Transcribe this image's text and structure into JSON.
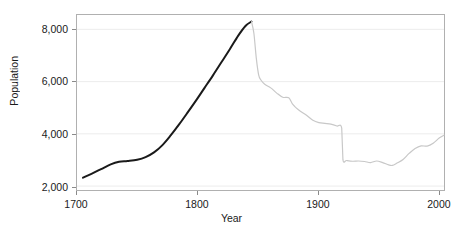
{
  "chart_data": {
    "type": "line",
    "title": "",
    "xlabel": "Year",
    "ylabel": "Population",
    "xlim": [
      1700,
      2005
    ],
    "ylim": [
      1850,
      8550
    ],
    "grid": true,
    "grid_axis": "y",
    "legend": "none",
    "xticks": [
      1700,
      1800,
      1900,
      2000
    ],
    "xtick_labels": [
      "1700",
      "1800",
      "1900",
      "2000"
    ],
    "yticks": [
      2000,
      4000,
      6000,
      8000
    ],
    "ytick_labels": [
      "2,000",
      "4,000",
      "6,000",
      "8,000"
    ],
    "colors": {
      "pre_famine_line": "#1a1a1a",
      "post_famine_line": "#c8c8c8",
      "gridline": "#ececec",
      "frame": "#b0b0b0",
      "text": "#1a1a1a"
    },
    "series": [
      {
        "name": "pre_famine",
        "color": "#1a1a1a",
        "width": 2.0,
        "x": [
          1705,
          1712,
          1720,
          1728,
          1735,
          1742,
          1750,
          1757,
          1764,
          1771,
          1778,
          1785,
          1792,
          1799,
          1806,
          1813,
          1820,
          1827,
          1834,
          1840,
          1845
        ],
        "y": [
          2320,
          2470,
          2650,
          2830,
          2930,
          2960,
          3010,
          3110,
          3290,
          3570,
          3950,
          4370,
          4820,
          5280,
          5760,
          6240,
          6740,
          7240,
          7760,
          8130,
          8300
        ]
      },
      {
        "name": "post_famine",
        "color": "#c8c8c8",
        "width": 1.2,
        "x": [
          1845,
          1847,
          1849,
          1851,
          1853,
          1856,
          1861,
          1866,
          1871,
          1876,
          1879,
          1884,
          1891,
          1896,
          1901,
          1906,
          1911,
          1916,
          1920,
          1921,
          1924,
          1929,
          1934,
          1939,
          1944,
          1949,
          1954,
          1959,
          1962,
          1966,
          1971,
          1976,
          1981,
          1986,
          1991,
          1996,
          2001,
          2005
        ],
        "y": [
          8300,
          7850,
          6900,
          6250,
          6050,
          5900,
          5760,
          5560,
          5400,
          5380,
          5150,
          4920,
          4700,
          4520,
          4430,
          4400,
          4370,
          4300,
          4220,
          3010,
          2980,
          2950,
          2960,
          2940,
          2900,
          2960,
          2900,
          2810,
          2790,
          2880,
          3020,
          3250,
          3440,
          3540,
          3530,
          3640,
          3840,
          3950
        ]
      }
    ],
    "annotations": [
      {
        "label": "peak",
        "x": 1845,
        "y": 8300,
        "note": "pre-famine maximum"
      },
      {
        "label": "discontinuity",
        "x": 1920,
        "y_from": 4220,
        "y_to": 3010,
        "note": "vertical step down"
      }
    ]
  }
}
